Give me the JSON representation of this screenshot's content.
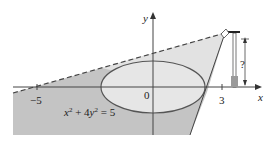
{
  "figure": {
    "equation_label": "x² + 4y² = 5",
    "equation_parts": {
      "x": "x",
      "x_exp": "2",
      "plus": " + 4",
      "y": "y",
      "y_exp": "2",
      "rhs": " = 5"
    },
    "axes": {
      "x_label": "x",
      "y_label": "y",
      "origin_label": "0",
      "tick_neg5": "−5",
      "tick_3": "3"
    },
    "lamp": {
      "height_label": "?"
    },
    "colors": {
      "shadow_dark": "#c2c2c2",
      "light_region": "#e4e4e4",
      "ellipse_fill": "#e6e6e6",
      "lamp_base": "#9a9a9a",
      "line": "#333333"
    }
  }
}
